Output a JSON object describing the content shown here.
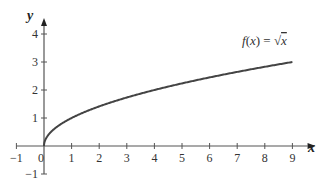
{
  "chart_data": {
    "type": "line",
    "title": "",
    "xlabel": "x",
    "ylabel": "y",
    "xlim": [
      -1,
      9.5
    ],
    "ylim": [
      -1,
      4.5
    ],
    "grid": false,
    "x_ticks": [
      -1,
      0,
      1,
      2,
      3,
      4,
      5,
      6,
      7,
      8,
      9
    ],
    "y_ticks": [
      -1,
      1,
      2,
      3,
      4
    ],
    "x_tick_labels": [
      "−1",
      "0",
      "1",
      "2",
      "3",
      "4",
      "5",
      "6",
      "7",
      "8",
      "9"
    ],
    "y_tick_labels": [
      "−1",
      "1",
      "2",
      "3",
      "4"
    ],
    "series": [
      {
        "name": "f(x) = √x",
        "x": [
          0,
          0.25,
          1,
          2,
          3,
          4,
          5,
          6,
          7,
          8,
          9
        ],
        "y": [
          0,
          0.5,
          1,
          1.414,
          1.732,
          2,
          2.236,
          2.449,
          2.646,
          2.828,
          3
        ],
        "color": "#444444"
      }
    ],
    "annotations": [
      {
        "text": "f(x) = √x",
        "x": 8,
        "y": 3.4
      }
    ]
  },
  "labels": {
    "x_axis": "x",
    "y_axis": "y",
    "function_prefix": "f(x) = ",
    "function_sqrt": "√",
    "function_arg": "x"
  },
  "colors": {
    "axis": "#555555",
    "curve": "#444444"
  }
}
